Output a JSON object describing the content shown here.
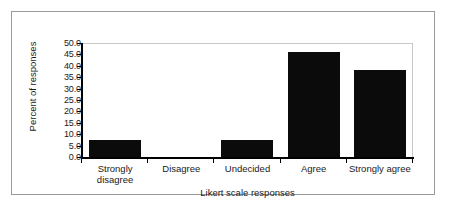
{
  "chart_data": {
    "type": "bar",
    "title": "",
    "subtitle": "",
    "xlabel": "Likert scale responses",
    "ylabel": "Percent of responses",
    "categories": [
      "Strongly disagree",
      "Disagree",
      "Undecided",
      "Agree",
      "Strongly agree"
    ],
    "category_lines": [
      [
        "Strongly",
        "disagree"
      ],
      [
        "Disagree"
      ],
      [
        "Undecided"
      ],
      [
        "Agree"
      ],
      [
        "Strongly agree"
      ]
    ],
    "values": [
      7.5,
      0,
      7.5,
      46,
      38
    ],
    "ylim": [
      0,
      50
    ],
    "ytick_step": 5,
    "ytick_labels": [
      "50.0",
      "45.0",
      "40.0",
      "35.0",
      "30.0",
      "25.0",
      "20.0",
      "15.0",
      "10.0",
      "5.0",
      "0.0"
    ],
    "grid": false,
    "legend": false,
    "legend_position": "none",
    "bar_color": "#0b0b0b",
    "axis_color": "#000000",
    "plot_border_color": "#c8c8c8",
    "frame_color": "#9a9a9a",
    "background_color": "#ffffff"
  }
}
